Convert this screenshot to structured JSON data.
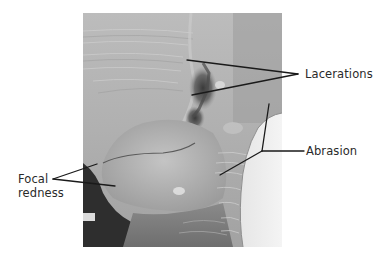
{
  "figure": {
    "photo": {
      "description": "grayscale clinical photograph",
      "tone": "grayscale"
    },
    "annotations": [
      {
        "id": "lacerations",
        "label": "Lacerations"
      },
      {
        "id": "abrasion",
        "label": "Abrasion"
      },
      {
        "id": "focal-redness",
        "label_lines": [
          "Focal",
          "redness"
        ]
      }
    ],
    "colors": {
      "background": "#ffffff",
      "leader_line": "#1a1a1a",
      "label_text": "#2a2a2a"
    }
  }
}
